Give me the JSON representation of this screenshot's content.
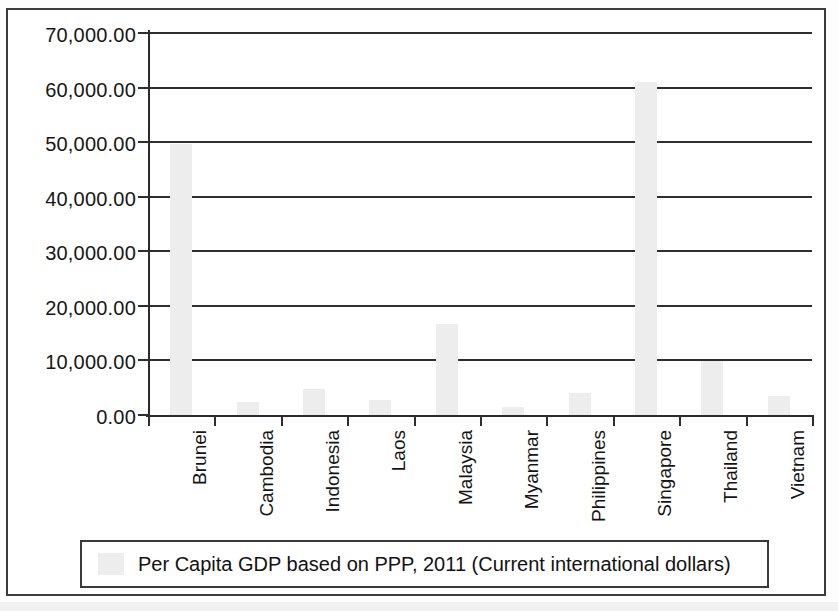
{
  "chart_data": {
    "type": "bar",
    "title": "",
    "subtitle": "",
    "xlabel": "",
    "ylabel": "",
    "categories": [
      "Brunei",
      "Cambodia",
      "Indonesia",
      "Laos",
      "Malaysia",
      "Myanmar",
      "Philippines",
      "Singapore",
      "Thailand",
      "Vietnam"
    ],
    "values": [
      49500,
      2300,
      4700,
      2700,
      16600,
      1400,
      4100,
      60800,
      9800,
      3400
    ],
    "series": [
      {
        "name": "Per Capita GDP based on PPP, 2011 (Current international dollars)",
        "values": [
          49500,
          2300,
          4700,
          2700,
          16600,
          1400,
          4100,
          60800,
          9800,
          3400
        ]
      }
    ],
    "ylim": [
      0,
      70000
    ],
    "ytick_values": [
      0,
      10000,
      20000,
      30000,
      40000,
      50000,
      60000,
      70000
    ],
    "ytick_labels": [
      "0.00",
      "10,000.00",
      "20,000.00",
      "30,000.00",
      "40,000.00",
      "50,000.00",
      "60,000.00",
      "70,000.00"
    ],
    "grid": true,
    "grid_axis": "y",
    "legend_position": "bottom",
    "legend_entries": [
      "Per Capita GDP based on PPP, 2011 (Current international dollars)"
    ],
    "bar_color": "#ededed",
    "axis_color": "#2e2e2e",
    "annotations": []
  },
  "axis": {
    "y_labels": [
      "70,000.00",
      "60,000.00",
      "50,000.00",
      "40,000.00",
      "30,000.00",
      "20,000.00",
      "10,000.00",
      "0.00"
    ],
    "x_labels": [
      "Brunei",
      "Cambodia",
      "Indonesia",
      "Laos",
      "Malaysia",
      "Myanmar",
      "Philippines",
      "Singapore",
      "Thailand",
      "Vietnam"
    ]
  },
  "legend": {
    "label": "Per Capita GDP based on PPP, 2011 (Current international dollars)",
    "swatch_color": "#ededed"
  }
}
